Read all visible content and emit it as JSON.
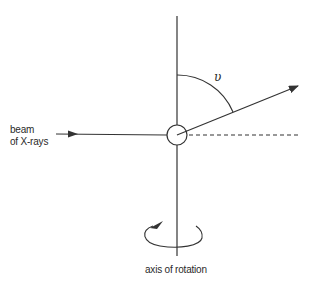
{
  "diagram": {
    "type": "x-ray diffraction geometry",
    "labels": {
      "beam_line1": "beam",
      "beam_line2": "of X-rays",
      "angle": "υ",
      "axis": "axis of rotation"
    },
    "colors": {
      "stroke": "#333333",
      "text": "#2a2a2a",
      "background": "#ffffff"
    },
    "elements": [
      "vertical rotation axis",
      "crystal (circle) at origin",
      "incident X-ray beam with arrow",
      "undeviated direction (dashed)",
      "diffracted ray with arrow",
      "angle arc υ from rotation axis",
      "rotation direction arrow"
    ]
  }
}
